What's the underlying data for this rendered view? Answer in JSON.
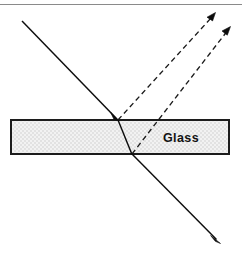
{
  "figure": {
    "width": 242,
    "height": 254,
    "background_color": "#ffffff"
  },
  "frame": {
    "top_rule": {
      "color": "#8a8a8a",
      "y": 4,
      "x1": 0,
      "x2": 242
    }
  },
  "slab": {
    "label": "Glass",
    "label_x": 163,
    "label_y": 142,
    "x": 11,
    "y": 120,
    "width": 218,
    "height": 34,
    "fill_color": "#f0f0f0",
    "border_color": "#1c1c1c",
    "hatch_color": "#d8d8d8"
  },
  "rays": [
    {
      "name": "incident-ray",
      "style": "solid",
      "color": "#0d0d0d",
      "x1": 22,
      "y1": 21,
      "x2": 118,
      "y2": 120,
      "arrow": "end",
      "arrow_x": 118,
      "arrow_y": 120,
      "description": "Incident beam travelling down-right toward the upper glass surface"
    },
    {
      "name": "refracted-ray-inside-glass",
      "style": "solid",
      "color": "#0d0d0d",
      "x1": 118,
      "y1": 120,
      "x2": 132,
      "y2": 154,
      "arrow": "none",
      "description": "Beam bent toward the normal while inside the glass"
    },
    {
      "name": "transmitted-ray",
      "style": "solid",
      "color": "#0d0d0d",
      "x1": 132,
      "y1": 154,
      "x2": 220,
      "y2": 243,
      "arrow": "end",
      "arrow_x": 220,
      "arrow_y": 243,
      "description": "Beam emerging below the slab, parallel to the incident beam"
    },
    {
      "name": "reflected-ray-top-surface",
      "style": "dashed",
      "color": "#1a1a1a",
      "x1": 118,
      "y1": 120,
      "x2": 215,
      "y2": 13,
      "arrow": "end",
      "arrow_x": 215,
      "arrow_y": 13,
      "description": "Partial reflection from the top glass surface"
    },
    {
      "name": "reflected-ray-bottom-surface",
      "style": "dashed",
      "color": "#1a1a1a",
      "x1": 132,
      "y1": 154,
      "x2": 230,
      "y2": 27,
      "arrow": "end",
      "arrow_x": 230,
      "arrow_y": 27,
      "description": "Internally reflected beam leaving through the top surface"
    }
  ]
}
